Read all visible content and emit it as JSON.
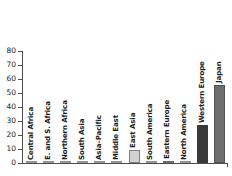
{
  "chart_data": {
    "type": "bar",
    "title": "",
    "subtitle": "",
    "xlabel": "",
    "ylabel": "",
    "ylim": [
      0,
      80
    ],
    "yticks": [
      0,
      10,
      20,
      30,
      40,
      50,
      60,
      70,
      80
    ],
    "ytick_labels": [
      "0",
      "10",
      "20",
      "30",
      "40",
      "50",
      "60",
      "70",
      "80"
    ],
    "grid": false,
    "legend": false,
    "legend_position": "none",
    "categories": [
      "Central Africa",
      "E. and S. Africa",
      "Northern Africa",
      "South Asia",
      "Asia–Pacific",
      "Middle East",
      "East Asia",
      "South America",
      "Eastern Europe",
      "North America",
      "Western Europe",
      "Japan"
    ],
    "values": [
      0.2,
      0.2,
      0.2,
      0.3,
      0.3,
      0.4,
      9.0,
      0.4,
      1.6,
      0.5,
      27.5,
      56.0
    ],
    "bar_colors": [
      "#bfbfbf",
      "#bfbfbf",
      "#bfbfbf",
      "#bfbfbf",
      "#bfbfbf",
      "#bfbfbf",
      "#d2d2d2",
      "#bfbfbf",
      "#3f3f3f",
      "#bfbfbf",
      "#3a3a3a",
      "#6e6e6e"
    ],
    "label_orientation": "vertical",
    "axis_color": "#4d4d4d",
    "background_color": "#ffffff",
    "text_color": "#1a1a1a"
  }
}
